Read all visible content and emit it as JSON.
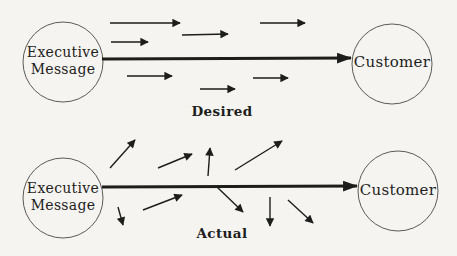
{
  "colors": {
    "background": "#f5f4f1",
    "ink": "#1d1d1b",
    "circle_stroke": "#5a5a56"
  },
  "desired": {
    "source_line1": "Executive",
    "source_line2": "Message",
    "target": "Customer",
    "label": "Desired",
    "main_arrow": {
      "x1": 102,
      "y1": 59,
      "x2": 351,
      "y2": 58
    },
    "arrows": [
      [
        110,
        23,
        180,
        23
      ],
      [
        260,
        23,
        305,
        23
      ],
      [
        182,
        35,
        228,
        34
      ],
      [
        111,
        42,
        148,
        42
      ],
      [
        127,
        76,
        172,
        76
      ],
      [
        253,
        78,
        288,
        78
      ],
      [
        200,
        89,
        235,
        89
      ]
    ]
  },
  "actual": {
    "source_line1": "Executive",
    "source_line2": "Message",
    "target": "Customer",
    "label": "Actual",
    "main_arrow": {
      "x1": 102,
      "y1": 187,
      "x2": 357,
      "y2": 186
    },
    "arrows": [
      [
        110,
        168,
        135,
        140
      ],
      [
        158,
        168,
        192,
        154
      ],
      [
        208,
        176,
        210,
        148
      ],
      [
        235,
        170,
        282,
        141
      ],
      [
        118,
        207,
        123,
        225
      ],
      [
        143,
        210,
        182,
        195
      ],
      [
        217,
        187,
        243,
        212
      ],
      [
        270,
        197,
        270,
        226
      ],
      [
        288,
        200,
        313,
        223
      ]
    ]
  }
}
